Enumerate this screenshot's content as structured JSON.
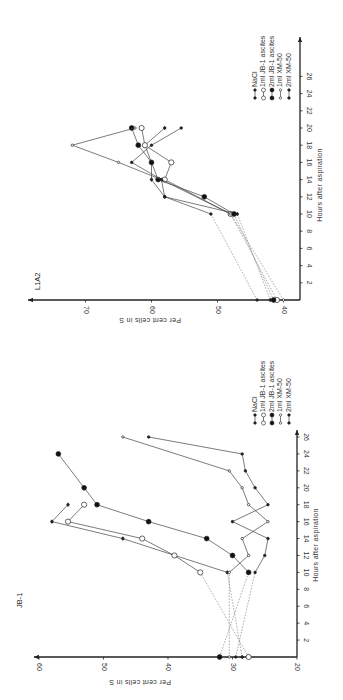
{
  "chart_data": [
    {
      "type": "line",
      "title": "JB-1",
      "xlabel": "Hours after aspiration",
      "ylabel": "Per cent cells in S",
      "xlim": [
        0,
        28
      ],
      "ylim": [
        20,
        62
      ],
      "x_ticks": [
        2,
        4,
        6,
        8,
        10,
        12,
        14,
        16,
        18,
        20,
        22,
        24,
        26
      ],
      "y_ticks": [
        20,
        30,
        40,
        50,
        60
      ],
      "grid": false,
      "legend_position": "upper right (rotated)",
      "orientation": "figure rotated 90 degrees counter-clockwise",
      "series": [
        {
          "name": "NaCl",
          "marker": "small-filled-bar",
          "x": [
            0,
            10,
            14,
            16,
            18
          ],
          "values": [
            28.5,
            30.8,
            47,
            58,
            55.5
          ]
        },
        {
          "name": "1ml JB-1 ascites",
          "marker": "open-circle",
          "x": [
            0,
            10,
            12,
            14,
            16,
            18
          ],
          "values": [
            27.5,
            35,
            39,
            44,
            55.5,
            53
          ]
        },
        {
          "name": "2ml JB-1 ascites",
          "marker": "filled-circle",
          "x": [
            0,
            10,
            12,
            14,
            16,
            18,
            20,
            24
          ],
          "values": [
            32,
            27.5,
            30,
            34,
            43,
            51,
            53,
            57
          ]
        },
        {
          "name": "1ml XM-50",
          "marker": "small-open",
          "x": [
            0,
            10,
            12,
            14,
            16,
            18,
            20,
            22,
            26
          ],
          "values": [
            30.5,
            30.5,
            27.5,
            28.5,
            24.5,
            27.5,
            28.5,
            30.5,
            47
          ]
        },
        {
          "name": "2ml XM-50",
          "marker": "small-filled",
          "x": [
            0,
            10,
            12,
            14,
            16,
            18,
            20,
            22,
            24,
            26
          ],
          "values": [
            29.5,
            26.5,
            25,
            24.5,
            30,
            24.5,
            26.5,
            28,
            28.5,
            43
          ]
        }
      ]
    },
    {
      "type": "line",
      "title": "L1A2",
      "xlabel": "Hours after aspiration",
      "ylabel": "Per cent cells in S",
      "xlim": [
        0,
        28
      ],
      "ylim": [
        37,
        74
      ],
      "x_ticks": [
        2,
        4,
        6,
        8,
        10,
        12,
        14,
        16,
        18,
        20,
        22,
        24,
        26
      ],
      "y_ticks": [
        40,
        50,
        60,
        70
      ],
      "grid": false,
      "legend_position": "upper right (rotated)",
      "orientation": "figure rotated 90 degrees counter-clockwise",
      "series": [
        {
          "name": "NaCl",
          "marker": "small-filled-bar",
          "x": [
            0,
            10,
            12,
            14,
            16,
            18,
            20
          ],
          "values": [
            42,
            47,
            58,
            60,
            60,
            61,
            58
          ]
        },
        {
          "name": "1ml JB-1 ascites",
          "marker": "open-circle",
          "x": [
            0,
            10,
            14,
            16,
            18,
            20
          ],
          "values": [
            41,
            48,
            58,
            57,
            61,
            61.5
          ]
        },
        {
          "name": "2ml JB-1 ascites",
          "marker": "filled-circle",
          "x": [
            0,
            10,
            12,
            14,
            16,
            18,
            20
          ],
          "values": [
            41.5,
            47.5,
            52,
            59,
            60,
            62,
            63
          ]
        },
        {
          "name": "1ml XM-50",
          "marker": "small-open",
          "x": [
            0,
            10,
            14,
            16,
            18,
            20
          ],
          "values": [
            40,
            48,
            58.5,
            65,
            72,
            62.5
          ]
        },
        {
          "name": "2ml XM-50",
          "marker": "small-filled",
          "x": [
            0,
            10,
            12,
            14,
            16,
            18,
            20
          ],
          "values": [
            44,
            51,
            58,
            58.5,
            63,
            60,
            55.5
          ]
        }
      ]
    }
  ],
  "charts": {
    "top": {
      "title": "L1A2",
      "xlabel": "Hours after aspiration",
      "ylabel": "Per cent cells in S",
      "y_tick_labels": [
        "70",
        "60",
        "50",
        "40"
      ],
      "x_tick_labels": [
        "2",
        "4",
        "6",
        "8",
        "10",
        "12",
        "14",
        "16",
        "18",
        "20",
        "22",
        "24",
        "26"
      ],
      "legend": [
        "NaCl",
        "1ml JB-1 ascites",
        "2ml JB-1 ascites",
        "1ml XM-50",
        "2ml XM-50"
      ]
    },
    "bottom": {
      "title": "JB-1",
      "xlabel": "Hours after aspiration",
      "ylabel": "Per cent cells in S",
      "y_tick_labels": [
        "60",
        "50",
        "40",
        "30",
        "20"
      ],
      "x_tick_labels": [
        "2",
        "4",
        "6",
        "8",
        "10",
        "12",
        "14",
        "16",
        "18",
        "20",
        "22",
        "24",
        "26"
      ],
      "legend": [
        "NaCl",
        "1ml JB-1 ascites",
        "2ml JB-1 ascites",
        "1ml XM-50",
        "2ml XM-50"
      ]
    }
  },
  "colors": {
    "ink": "#333333",
    "background": "#ffffff"
  }
}
